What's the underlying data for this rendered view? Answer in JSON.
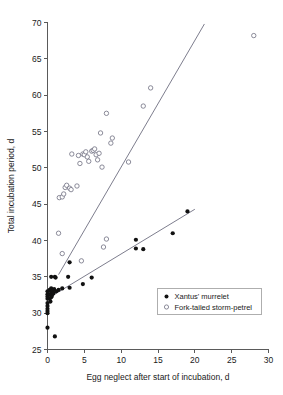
{
  "chart_data": {
    "type": "scatter",
    "title": "",
    "xlabel": "Egg neglect after start of incubation, d",
    "ylabel": "Total incubation period, d",
    "xlim": [
      0,
      30
    ],
    "ylim": [
      25,
      70
    ],
    "xticks": [
      0,
      5,
      10,
      15,
      20,
      25,
      30
    ],
    "yticks": [
      25,
      30,
      35,
      40,
      45,
      50,
      55,
      60,
      65,
      70
    ],
    "xtick_labels": [
      "0",
      "5",
      "10",
      "15",
      "20",
      "25",
      "30"
    ],
    "ytick_labels": [
      "25",
      "30",
      "35",
      "40",
      "45",
      "50",
      "55",
      "60",
      "65",
      "70"
    ],
    "grid": false,
    "legend_position": "lower-right",
    "series": [
      {
        "name": "Xantus' murrelet",
        "marker": "filled-circle",
        "color": "#111111",
        "points": [
          [
            0.0,
            28.0
          ],
          [
            0.0,
            30.0
          ],
          [
            0.0,
            30.3
          ],
          [
            0.0,
            30.6
          ],
          [
            0.0,
            31.0
          ],
          [
            0.0,
            31.4
          ],
          [
            0.0,
            32.0
          ],
          [
            0.0,
            32.3
          ],
          [
            0.0,
            32.6
          ],
          [
            0.0,
            33.0
          ],
          [
            0.3,
            32.0
          ],
          [
            0.3,
            32.6
          ],
          [
            0.3,
            33.2
          ],
          [
            0.4,
            31.6
          ],
          [
            0.5,
            32.2
          ],
          [
            0.5,
            32.9
          ],
          [
            0.5,
            33.4
          ],
          [
            0.6,
            32.4
          ],
          [
            0.7,
            33.0
          ],
          [
            0.8,
            32.7
          ],
          [
            0.9,
            33.3
          ],
          [
            0.5,
            35.0
          ],
          [
            1.0,
            26.8
          ],
          [
            1.0,
            35.0
          ],
          [
            1.1,
            34.9
          ],
          [
            1.2,
            33.0
          ],
          [
            1.5,
            33.2
          ],
          [
            2.0,
            33.4
          ],
          [
            2.8,
            35.0
          ],
          [
            3.0,
            33.5
          ],
          [
            3.0,
            37.0
          ],
          [
            4.8,
            34.0
          ],
          [
            6.0,
            34.9
          ],
          [
            12.0,
            40.1
          ],
          [
            12.0,
            38.9
          ],
          [
            13.0,
            38.8
          ],
          [
            17.0,
            41.0
          ],
          [
            19.0,
            44.0
          ]
        ],
        "fit_line": {
          "x": [
            0.0,
            20.0
          ],
          "y": [
            32.0,
            44.3
          ]
        }
      },
      {
        "name": "Fork-tailed storm-petrel",
        "marker": "open-circle",
        "color": "#6e6e80",
        "points": [
          [
            1.5,
            41.0
          ],
          [
            1.6,
            45.9
          ],
          [
            2.0,
            38.2
          ],
          [
            2.0,
            46.0
          ],
          [
            2.2,
            46.4
          ],
          [
            2.4,
            47.3
          ],
          [
            2.6,
            47.6
          ],
          [
            3.0,
            47.2
          ],
          [
            3.2,
            47.0
          ],
          [
            3.3,
            51.9
          ],
          [
            4.0,
            47.5
          ],
          [
            4.2,
            51.7
          ],
          [
            4.4,
            50.6
          ],
          [
            4.6,
            37.2
          ],
          [
            4.8,
            51.9
          ],
          [
            5.0,
            51.8
          ],
          [
            5.2,
            52.2
          ],
          [
            5.4,
            51.5
          ],
          [
            5.6,
            50.9
          ],
          [
            6.0,
            52.3
          ],
          [
            6.2,
            52.4
          ],
          [
            6.4,
            52.6
          ],
          [
            6.6,
            51.8
          ],
          [
            6.8,
            51.1
          ],
          [
            7.0,
            52.0
          ],
          [
            7.2,
            54.8
          ],
          [
            7.4,
            50.1
          ],
          [
            7.6,
            39.1
          ],
          [
            8.0,
            40.2
          ],
          [
            8.0,
            57.5
          ],
          [
            8.6,
            53.4
          ],
          [
            8.8,
            54.1
          ],
          [
            11.0,
            50.8
          ],
          [
            13.0,
            58.5
          ],
          [
            14.0,
            61.0
          ],
          [
            28.0,
            68.2
          ]
        ],
        "fit_line": {
          "x": [
            1.5,
            21.3
          ],
          "y": [
            35.3,
            69.8
          ]
        }
      }
    ]
  },
  "legend": {
    "entries": [
      {
        "label": "Xantus' murrelet",
        "marker": "filled-circle"
      },
      {
        "label": "Fork-tailed storm-petrel",
        "marker": "open-circle"
      }
    ]
  },
  "colors": {
    "axis": "#5a5a5a",
    "filled_marker": "#111111",
    "open_marker": "#6e6e80",
    "fit_line": "#6e6e80",
    "background": "#ffffff"
  }
}
